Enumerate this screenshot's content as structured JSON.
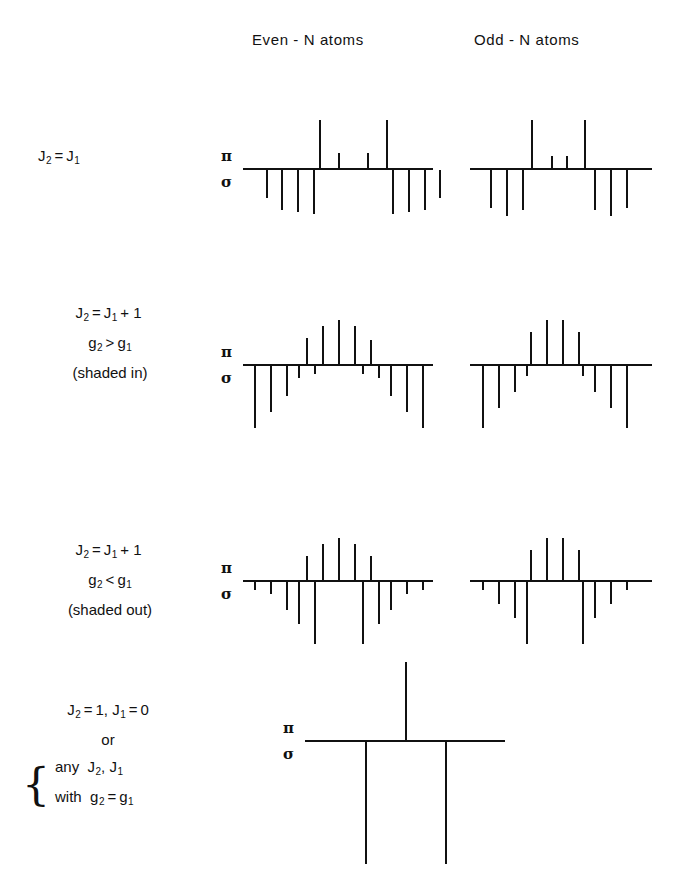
{
  "figure": {
    "title_columns": {
      "even": "Even - N  atoms",
      "odd": "Odd - N  atoms"
    },
    "axis_labels": {
      "pi": "π",
      "sigma": "σ"
    },
    "rows": [
      {
        "id": "row-1",
        "label_lines": [
          "J2 = J1"
        ],
        "label_plain": "J₂ = J₁",
        "condition": "J2 equals J1",
        "has_even": true,
        "has_odd": true
      },
      {
        "id": "row-2",
        "label_lines": [
          "J2 = J1 + 1",
          "g2 > g1",
          "(shaded in)"
        ],
        "condition": "J2 = J1 + 1, g2 greater than g1, shaded in",
        "has_even": true,
        "has_odd": true
      },
      {
        "id": "row-3",
        "label_lines": [
          "J2 = J1 + 1",
          "g2 < g1",
          "(shaded out)"
        ],
        "condition": "J2 = J1 + 1, g2 less than g1, shaded out",
        "has_even": true,
        "has_odd": true
      },
      {
        "id": "row-4",
        "label_lines": [
          "J2 = 1, J1 = 0",
          "or",
          "any  J2, J1",
          "with  g2 = g1"
        ],
        "brace": "{",
        "condition": "J2 = 1, J1 = 0 or any J2, J1 with g2 = g1",
        "has_even": false,
        "has_odd": false,
        "single": true
      }
    ],
    "text": {
      "J": "J",
      "g": "g",
      "sub2": "2",
      "sub1": "1",
      "eq": "=",
      "gt": ">",
      "lt": "<",
      "plus_one": "+ 1",
      "one": "1",
      "zero": "0",
      "or": "or",
      "any": "any",
      "with": "with",
      "shaded_in": "(shaded in)",
      "shaded_out": "(shaded out)",
      "comma": ","
    }
  },
  "chart_data": {
    "type": "bar",
    "xlabel": "",
    "ylabel": "relative intensity (π up / σ down)",
    "grid": false,
    "legend": "none",
    "note": "Each panel: horizontal baseline; π components drawn upward, σ components drawn downward. Positions in px relative to panel left edge, heights in px.",
    "panels": [
      {
        "row": "row-1",
        "column": "even",
        "left": 243,
        "top": 118,
        "width": 190,
        "baseline_y": 50,
        "pi": [
          {
            "x": 76,
            "h": 48
          },
          {
            "x": 95,
            "h": 15
          },
          {
            "x": 124,
            "h": 15
          },
          {
            "x": 143,
            "h": 48
          }
        ],
        "sigma": [
          {
            "x": 23,
            "h": 28
          },
          {
            "x": 38,
            "h": 40
          },
          {
            "x": 54,
            "h": 42
          },
          {
            "x": 70,
            "h": 44
          },
          {
            "x": 149,
            "h": 44
          },
          {
            "x": 165,
            "h": 42
          },
          {
            "x": 181,
            "h": 40
          },
          {
            "x": 196,
            "h": 28
          }
        ]
      },
      {
        "row": "row-1",
        "column": "odd",
        "left": 470,
        "top": 118,
        "width": 182,
        "baseline_y": 50,
        "pi": [
          {
            "x": 61,
            "h": 48
          },
          {
            "x": 81,
            "h": 12
          },
          {
            "x": 96,
            "h": 12
          },
          {
            "x": 114,
            "h": 48
          }
        ],
        "sigma": [
          {
            "x": 20,
            "h": 38
          },
          {
            "x": 36,
            "h": 46
          },
          {
            "x": 52,
            "h": 40
          },
          {
            "x": 124,
            "h": 40
          },
          {
            "x": 140,
            "h": 46
          },
          {
            "x": 156,
            "h": 38
          }
        ]
      },
      {
        "row": "row-2",
        "column": "even",
        "left": 243,
        "top": 318,
        "width": 190,
        "baseline_y": 46,
        "pi": [
          {
            "x": 63,
            "h": 26
          },
          {
            "x": 79,
            "h": 38
          },
          {
            "x": 95,
            "h": 44
          },
          {
            "x": 111,
            "h": 38
          },
          {
            "x": 127,
            "h": 24
          }
        ],
        "sigma": [
          {
            "x": 11,
            "h": 62
          },
          {
            "x": 27,
            "h": 46
          },
          {
            "x": 43,
            "h": 30
          },
          {
            "x": 55,
            "h": 12
          },
          {
            "x": 71,
            "h": 8
          },
          {
            "x": 119,
            "h": 8
          },
          {
            "x": 135,
            "h": 12
          },
          {
            "x": 147,
            "h": 30
          },
          {
            "x": 163,
            "h": 46
          },
          {
            "x": 179,
            "h": 62
          }
        ]
      },
      {
        "row": "row-2",
        "column": "odd",
        "left": 470,
        "top": 318,
        "width": 182,
        "baseline_y": 46,
        "pi": [
          {
            "x": 60,
            "h": 32
          },
          {
            "x": 76,
            "h": 44
          },
          {
            "x": 92,
            "h": 44
          },
          {
            "x": 108,
            "h": 32
          }
        ],
        "sigma": [
          {
            "x": 12,
            "h": 62
          },
          {
            "x": 28,
            "h": 42
          },
          {
            "x": 44,
            "h": 26
          },
          {
            "x": 56,
            "h": 10
          },
          {
            "x": 112,
            "h": 10
          },
          {
            "x": 124,
            "h": 26
          },
          {
            "x": 140,
            "h": 42
          },
          {
            "x": 156,
            "h": 62
          }
        ]
      },
      {
        "row": "row-3",
        "column": "even",
        "left": 243,
        "top": 540,
        "width": 190,
        "baseline_y": 40,
        "pi": [
          {
            "x": 63,
            "h": 24
          },
          {
            "x": 79,
            "h": 36
          },
          {
            "x": 95,
            "h": 42
          },
          {
            "x": 111,
            "h": 36
          },
          {
            "x": 127,
            "h": 24
          }
        ],
        "sigma": [
          {
            "x": 11,
            "h": 8
          },
          {
            "x": 27,
            "h": 12
          },
          {
            "x": 43,
            "h": 28
          },
          {
            "x": 55,
            "h": 42
          },
          {
            "x": 71,
            "h": 62
          },
          {
            "x": 119,
            "h": 62
          },
          {
            "x": 135,
            "h": 42
          },
          {
            "x": 147,
            "h": 28
          },
          {
            "x": 163,
            "h": 12
          },
          {
            "x": 179,
            "h": 8
          }
        ]
      },
      {
        "row": "row-3",
        "column": "odd",
        "left": 470,
        "top": 540,
        "width": 182,
        "baseline_y": 40,
        "pi": [
          {
            "x": 60,
            "h": 30
          },
          {
            "x": 76,
            "h": 42
          },
          {
            "x": 92,
            "h": 42
          },
          {
            "x": 108,
            "h": 30
          }
        ],
        "sigma": [
          {
            "x": 12,
            "h": 8
          },
          {
            "x": 28,
            "h": 22
          },
          {
            "x": 44,
            "h": 36
          },
          {
            "x": 56,
            "h": 62
          },
          {
            "x": 112,
            "h": 62
          },
          {
            "x": 124,
            "h": 36
          },
          {
            "x": 140,
            "h": 22
          },
          {
            "x": 156,
            "h": 8
          }
        ]
      },
      {
        "row": "row-4",
        "column": "center",
        "left": 305,
        "top": 660,
        "width": 200,
        "baseline_y": 80,
        "pi": [
          {
            "x": 100,
            "h": 78
          }
        ],
        "sigma": [
          {
            "x": 60,
            "h": 122
          },
          {
            "x": 140,
            "h": 122
          }
        ]
      }
    ]
  }
}
